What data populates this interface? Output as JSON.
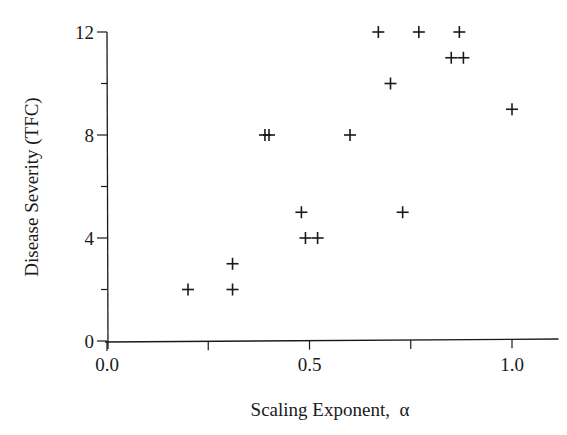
{
  "chart_data": {
    "type": "scatter",
    "title": "",
    "xlabel": "Scaling Exponent,  α",
    "ylabel": "Disease Severity (TFC)",
    "xlim": [
      0.0,
      1.1
    ],
    "ylim": [
      0,
      12
    ],
    "xticks": [
      0.0,
      0.25,
      0.5,
      0.75,
      1.0
    ],
    "xtick_labels": [
      "0.0",
      "",
      "0.5",
      "",
      "1.0"
    ],
    "yticks": [
      0,
      2,
      4,
      6,
      8,
      10,
      12
    ],
    "ytick_labels": [
      "0",
      "",
      "4",
      "",
      "8",
      "",
      "12"
    ],
    "grid": false,
    "legend": null,
    "marker": "+",
    "series": [
      {
        "name": "subjects",
        "points": [
          {
            "x": 0.2,
            "y": 2
          },
          {
            "x": 0.31,
            "y": 3
          },
          {
            "x": 0.31,
            "y": 2
          },
          {
            "x": 0.39,
            "y": 8
          },
          {
            "x": 0.4,
            "y": 8
          },
          {
            "x": 0.48,
            "y": 5
          },
          {
            "x": 0.49,
            "y": 4
          },
          {
            "x": 0.52,
            "y": 4
          },
          {
            "x": 0.6,
            "y": 8
          },
          {
            "x": 0.67,
            "y": 12
          },
          {
            "x": 0.7,
            "y": 10
          },
          {
            "x": 0.73,
            "y": 5
          },
          {
            "x": 0.77,
            "y": 12
          },
          {
            "x": 0.85,
            "y": 11
          },
          {
            "x": 0.87,
            "y": 12
          },
          {
            "x": 0.88,
            "y": 11
          },
          {
            "x": 1.0,
            "y": 9
          }
        ]
      }
    ]
  },
  "colors": {
    "ink": "#1a1a1a",
    "background": "#ffffff"
  }
}
